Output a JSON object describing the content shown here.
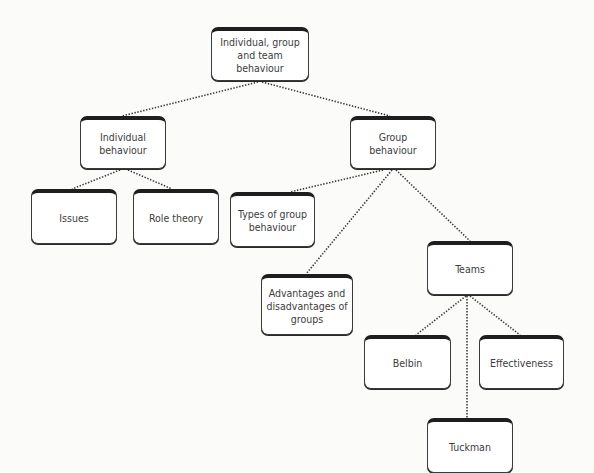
{
  "diagram": {
    "type": "tree",
    "colors": {
      "box_border": "#1e1e1e",
      "box_fill": "#ffffff",
      "text": "#3c3c3c",
      "connector": "#3a3a3a"
    },
    "nodes": [
      {
        "id": "root",
        "label": "Individual, group and team behaviour",
        "x": 211,
        "y": 27,
        "w": 98,
        "h": 54
      },
      {
        "id": "individual",
        "label": "Individual behaviour",
        "x": 80,
        "y": 116,
        "w": 86,
        "h": 53
      },
      {
        "id": "group",
        "label": "Group behaviour",
        "x": 350,
        "y": 116,
        "w": 86,
        "h": 53
      },
      {
        "id": "issues",
        "label": "Issues",
        "x": 31,
        "y": 189,
        "w": 86,
        "h": 55
      },
      {
        "id": "role",
        "label": "Role theory",
        "x": 133,
        "y": 189,
        "w": 86,
        "h": 55
      },
      {
        "id": "types",
        "label": "Types of group behaviour",
        "x": 230,
        "y": 192,
        "w": 85,
        "h": 55
      },
      {
        "id": "advantages",
        "label": "Advantages and disadvantages of groups",
        "x": 261,
        "y": 274,
        "w": 92,
        "h": 61
      },
      {
        "id": "teams",
        "label": "Teams",
        "x": 427,
        "y": 241,
        "w": 86,
        "h": 54
      },
      {
        "id": "belbin",
        "label": "Belbin",
        "x": 364,
        "y": 335,
        "w": 87,
        "h": 54
      },
      {
        "id": "effectiveness",
        "label": "Effectiveness",
        "x": 479,
        "y": 335,
        "w": 85,
        "h": 54
      },
      {
        "id": "tuckman",
        "label": "Tuckman",
        "x": 427,
        "y": 418,
        "w": 86,
        "h": 55
      }
    ],
    "edges": [
      {
        "from": "root",
        "to": "individual",
        "x1": 258,
        "y1": 82,
        "x2": 122,
        "y2": 116
      },
      {
        "from": "root",
        "to": "group",
        "x1": 262,
        "y1": 82,
        "x2": 390,
        "y2": 116
      },
      {
        "from": "individual",
        "to": "issues",
        "x1": 120,
        "y1": 170,
        "x2": 72,
        "y2": 189
      },
      {
        "from": "individual",
        "to": "role",
        "x1": 128,
        "y1": 170,
        "x2": 172,
        "y2": 189
      },
      {
        "from": "group",
        "to": "types",
        "x1": 383,
        "y1": 170,
        "x2": 290,
        "y2": 192
      },
      {
        "from": "group",
        "to": "advantages",
        "x1": 392,
        "y1": 170,
        "x2": 306,
        "y2": 274
      },
      {
        "from": "group",
        "to": "teams",
        "x1": 396,
        "y1": 170,
        "x2": 470,
        "y2": 241
      },
      {
        "from": "teams",
        "to": "belbin",
        "x1": 466,
        "y1": 296,
        "x2": 416,
        "y2": 335
      },
      {
        "from": "teams",
        "to": "effectiveness",
        "x1": 470,
        "y1": 296,
        "x2": 520,
        "y2": 335
      },
      {
        "from": "teams",
        "to": "tuckman",
        "x1": 467,
        "y1": 296,
        "x2": 467,
        "y2": 418
      }
    ]
  }
}
